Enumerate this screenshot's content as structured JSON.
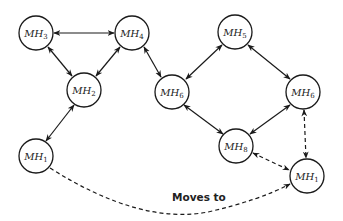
{
  "diagram": {
    "nodes": [
      {
        "id": "n1",
        "base": "MH",
        "sub": "3",
        "x": 36,
        "y": 33
      },
      {
        "id": "n2",
        "base": "MH",
        "sub": "4",
        "x": 132,
        "y": 33
      },
      {
        "id": "n3",
        "base": "MH",
        "sub": "2",
        "x": 84,
        "y": 90
      },
      {
        "id": "n4",
        "base": "MH",
        "sub": "1",
        "x": 36,
        "y": 156
      },
      {
        "id": "n5",
        "base": "MH",
        "sub": "5",
        "x": 235,
        "y": 32
      },
      {
        "id": "n6",
        "base": "MH",
        "sub": "6",
        "x": 172,
        "y": 92
      },
      {
        "id": "n7",
        "base": "MH",
        "sub": "6",
        "x": 303,
        "y": 92
      },
      {
        "id": "n8",
        "base": "MH",
        "sub": "8",
        "x": 236,
        "y": 146
      },
      {
        "id": "n9",
        "base": "MH",
        "sub": "1",
        "x": 307,
        "y": 176
      }
    ],
    "edges": [
      {
        "from": "MH3",
        "to": "MH4",
        "style": "solid",
        "bidirectional": true
      },
      {
        "from": "MH3",
        "to": "MH2",
        "style": "solid",
        "bidirectional": true
      },
      {
        "from": "MH4",
        "to": "MH2",
        "style": "solid",
        "bidirectional": true
      },
      {
        "from": "MH2",
        "to": "MH1",
        "style": "solid",
        "bidirectional": true
      },
      {
        "from": "MH4",
        "to": "MH6",
        "style": "solid",
        "bidirectional": true
      },
      {
        "from": "MH5",
        "to": "MH6",
        "style": "solid",
        "bidirectional": true
      },
      {
        "from": "MH5",
        "to": "MH6 (right)",
        "style": "solid",
        "bidirectional": true
      },
      {
        "from": "MH6",
        "to": "MH8",
        "style": "solid",
        "bidirectional": true
      },
      {
        "from": "MH6 (right)",
        "to": "MH8",
        "style": "solid",
        "bidirectional": true
      },
      {
        "from": "MH6 (right)",
        "to": "MH1 (right)",
        "style": "dashed",
        "bidirectional": true
      },
      {
        "from": "MH8",
        "to": "MH1 (right)",
        "style": "dashed",
        "bidirectional": true
      },
      {
        "from": "MH1 (left)",
        "to": "MH1 (right)",
        "style": "dashed",
        "bidirectional": false,
        "label": "Moves to"
      }
    ],
    "moves_label": "Moves to"
  }
}
